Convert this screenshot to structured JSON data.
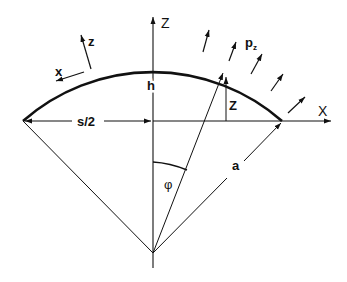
{
  "diagram": {
    "labels": {
      "global_z_axis": "Z",
      "global_x_axis": "X",
      "local_z": "z",
      "local_x": "x",
      "pressure": "p",
      "pressure_sub": "z",
      "height": "h",
      "half_span": "s/2",
      "ordinate": "Z",
      "radius": "a",
      "angle": "φ"
    },
    "colors": {
      "line": "#111111",
      "background": "#ffffff"
    }
  }
}
